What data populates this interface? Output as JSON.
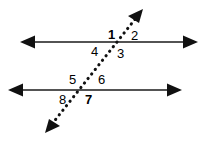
{
  "figure": {
    "name": "parallel-lines-transversal-diagram",
    "background_color": "#ffffff",
    "stroke_color": "#1a1a1a",
    "label_color": "#000000",
    "width": 212,
    "height": 144
  },
  "lines": {
    "upper_parallel": {
      "name": "upper horizontal line",
      "style": "solid",
      "x1": 22,
      "y1": 42,
      "x2": 196,
      "y2": 42,
      "arrow_start": true,
      "arrow_end": true
    },
    "lower_parallel": {
      "name": "lower horizontal line",
      "style": "solid",
      "x1": 10,
      "y1": 90,
      "x2": 180,
      "y2": 90,
      "arrow_start": true,
      "arrow_end": true
    },
    "transversal": {
      "name": "dotted transversal line",
      "style": "dotted",
      "x1": 47,
      "y1": 131,
      "x2": 141,
      "y2": 11,
      "arrow_start": true,
      "arrow_end": true
    }
  },
  "intersections": {
    "upper": {
      "x": 118,
      "y": 42
    },
    "lower": {
      "x": 86,
      "y": 90
    }
  },
  "angle_labels": [
    {
      "id": "angle-1",
      "text": "1",
      "x": 108,
      "y": 28,
      "weight": "bold",
      "position": "upper-left"
    },
    {
      "id": "angle-2",
      "text": "2",
      "x": 131,
      "y": 29,
      "weight": "regular",
      "position": "upper-right"
    },
    {
      "id": "angle-3",
      "text": "3",
      "x": 117,
      "y": 47,
      "weight": "regular",
      "position": "lower-right"
    },
    {
      "id": "angle-4",
      "text": "4",
      "x": 91,
      "y": 45,
      "weight": "regular",
      "position": "lower-left"
    },
    {
      "id": "angle-5",
      "text": "5",
      "x": 69,
      "y": 73,
      "weight": "regular",
      "position": "upper-left"
    },
    {
      "id": "angle-6",
      "text": "6",
      "x": 98,
      "y": 73,
      "weight": "regular",
      "position": "upper-right"
    },
    {
      "id": "angle-7",
      "text": "7",
      "x": 85,
      "y": 93,
      "weight": "bold",
      "position": "lower-right"
    },
    {
      "id": "angle-8",
      "text": "8",
      "x": 59,
      "y": 93,
      "weight": "regular",
      "position": "lower-left"
    }
  ]
}
